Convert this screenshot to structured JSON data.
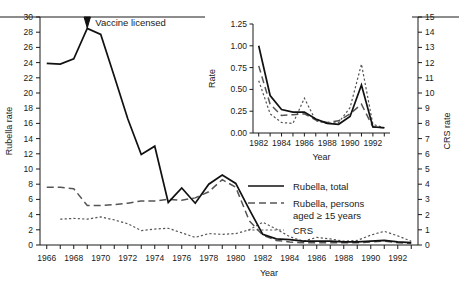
{
  "figure": {
    "annotation": "Vaccine licensed",
    "annotation_year": 1969
  },
  "main_axes": {
    "ylabel_left": "Rubella rate",
    "ylabel_right": "CRS rate",
    "xlabel": "Year",
    "ylim_left": [
      0,
      30
    ],
    "ylim_right": [
      0,
      15
    ],
    "ytick_step_left": 2,
    "ytick_step_right": 1,
    "xlim": [
      1965.5,
      1993.5
    ],
    "yticks_left": [
      "0",
      "2",
      "4",
      "6",
      "8",
      "10",
      "12",
      "14",
      "16",
      "18",
      "20",
      "22",
      "24",
      "26",
      "28",
      "30"
    ],
    "yticks_right": [
      "0",
      "1",
      "2",
      "3",
      "4",
      "5",
      "6",
      "7",
      "8",
      "9",
      "10",
      "11",
      "12",
      "13",
      "14",
      "15"
    ],
    "xticks_labeled": [
      "1966",
      "1968",
      "1970",
      "1972",
      "1974",
      "1976",
      "1978",
      "1980",
      "1982",
      "1984",
      "1986",
      "1988",
      "1990",
      "1992"
    ]
  },
  "inset_axes": {
    "ylabel": "Rate",
    "xlabel": "Year",
    "ylim": [
      0,
      1.25
    ],
    "xlim": [
      1981.5,
      1993.5
    ],
    "yticks": [
      "0.00",
      "0.25",
      "0.50",
      "0.75",
      "1.00",
      "1.25"
    ],
    "xticks_labeled": [
      "1982",
      "1984",
      "1986",
      "1988",
      "1990",
      "1992"
    ]
  },
  "legend": {
    "items": [
      {
        "label": "Rubella, total",
        "style": "solid",
        "color": "#111111"
      },
      {
        "label": "Rubella, persons aged ≥ 15 years",
        "style": "dashed",
        "color": "#555555"
      },
      {
        "label": "CRS",
        "style": "dotted",
        "color": "#555555"
      }
    ],
    "line2_part1": "Rubella, persons",
    "line2_part2": "aged ≥ 15 years"
  },
  "chart_data": {
    "type": "line",
    "title": "",
    "xlabel": "Year",
    "ylabel": "Rubella rate",
    "ylabel_secondary": "CRS rate",
    "ylim": [
      0,
      30
    ],
    "ylim_secondary": [
      0,
      15
    ],
    "grid": false,
    "legend_position": "center-right",
    "annotations": [
      {
        "text": "Vaccine licensed",
        "x": 1969,
        "y": 30
      }
    ],
    "x": [
      1966,
      1967,
      1968,
      1969,
      1970,
      1971,
      1972,
      1973,
      1974,
      1975,
      1976,
      1977,
      1978,
      1979,
      1980,
      1981,
      1982,
      1983,
      1984,
      1985,
      1986,
      1987,
      1988,
      1989,
      1990,
      1991,
      1992,
      1993
    ],
    "series": [
      {
        "name": "Rubella, total",
        "axis": "left",
        "style": "solid",
        "values": [
          23.9,
          23.8,
          24.5,
          28.5,
          27.7,
          22.2,
          16.6,
          11.9,
          13.0,
          5.6,
          7.5,
          5.5,
          8.0,
          9.2,
          8.1,
          4.7,
          1.4,
          0.8,
          0.7,
          0.5,
          0.5,
          0.5,
          0.4,
          0.4,
          0.5,
          0.6,
          0.4,
          0.3
        ]
      },
      {
        "name": "Rubella, persons aged ≥ 15 years",
        "axis": "left",
        "style": "dashed",
        "values": [
          7.6,
          7.6,
          7.4,
          5.2,
          5.2,
          5.3,
          5.5,
          5.8,
          5.8,
          6.0,
          5.9,
          6.2,
          7.0,
          8.6,
          7.6,
          3.2,
          1.3,
          0.6,
          0.4,
          0.3,
          0.3,
          0.3,
          0.3,
          0.3,
          0.4,
          0.5,
          0.3,
          0.2
        ]
      },
      {
        "name": "CRS",
        "axis": "right",
        "style": "dotted",
        "values": [
          null,
          1.7,
          1.75,
          1.7,
          1.85,
          1.65,
          1.4,
          0.95,
          1.05,
          1.1,
          0.8,
          0.5,
          0.75,
          0.7,
          0.75,
          1.0,
          1.5,
          1.05,
          0.55,
          0.25,
          0.5,
          0.4,
          0.25,
          0.3,
          0.65,
          0.9,
          0.6,
          0.25
        ]
      }
    ],
    "inset": {
      "type": "line",
      "xlabel": "Year",
      "ylabel": "Rate",
      "ylim": [
        0,
        1.25
      ],
      "x": [
        1982,
        1983,
        1984,
        1985,
        1986,
        1987,
        1988,
        1989,
        1990,
        1991,
        1992,
        1993
      ],
      "series": [
        {
          "name": "Rubella, total",
          "style": "solid",
          "values": [
            1.0,
            0.43,
            0.27,
            0.24,
            0.24,
            0.16,
            0.11,
            0.1,
            0.19,
            0.55,
            0.07,
            0.06
          ]
        },
        {
          "name": "Rubella, persons aged ≥ 15 years",
          "style": "dashed",
          "values": [
            0.77,
            0.33,
            0.2,
            0.21,
            0.22,
            0.15,
            0.12,
            0.14,
            0.22,
            0.33,
            0.07,
            0.06
          ]
        },
        {
          "name": "CRS",
          "style": "dotted",
          "values": [
            0.6,
            0.22,
            0.12,
            0.11,
            0.4,
            0.14,
            0.11,
            0.12,
            0.29,
            0.79,
            0.1,
            0.06
          ]
        }
      ]
    }
  }
}
